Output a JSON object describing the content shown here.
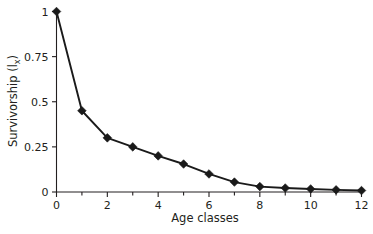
{
  "chart_data": {
    "type": "line",
    "title": "",
    "subtitle": "",
    "xlabel": "Age classes",
    "ylabel": "Survivorship (l",
    "ylabel_subscript": "x",
    "ylabel_suffix": ")",
    "ylabel_full": "Survivorship (lx)",
    "x": [
      0,
      1,
      2,
      3,
      4,
      5,
      6,
      7,
      8,
      9,
      10,
      11,
      12
    ],
    "values": [
      1.0,
      0.45,
      0.3,
      0.25,
      0.2,
      0.155,
      0.1,
      0.055,
      0.03,
      0.022,
      0.017,
      0.012,
      0.008
    ],
    "series": [
      {
        "name": "Survivorship",
        "values": [
          1.0,
          0.45,
          0.3,
          0.25,
          0.2,
          0.155,
          0.1,
          0.055,
          0.03,
          0.022,
          0.017,
          0.012,
          0.008
        ]
      }
    ],
    "xlim": [
      0,
      12
    ],
    "ylim": [
      0,
      1
    ],
    "x_ticks": [
      0,
      2,
      4,
      6,
      8,
      10,
      12
    ],
    "x_tick_labels": [
      "0",
      "2",
      "4",
      "6",
      "8",
      "10",
      "12"
    ],
    "x_minor_ticks": [
      1,
      3,
      5,
      7,
      9,
      11
    ],
    "y_ticks": [
      0,
      0.25,
      0.5,
      0.75,
      1
    ],
    "y_tick_labels": [
      "0",
      "0.25",
      "0.5",
      "0.75",
      "1"
    ],
    "grid": false,
    "legend": null,
    "legend_position": "none",
    "marker": "diamond",
    "line_color": "#1a1a1a",
    "marker_color": "#1a1a1a",
    "axis_color": "#231f20",
    "background_color": "#ffffff",
    "annotations": []
  }
}
